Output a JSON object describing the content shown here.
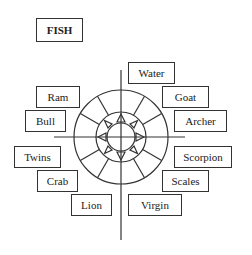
{
  "title": "FISH",
  "labels": {
    "water": "Water",
    "goat": "Goat",
    "archer": "Archer",
    "ram": "Ram",
    "bull": "Bull",
    "twins": "Twins",
    "crab": "Crab",
    "lion": "Lion",
    "scorpion": "Scorpion",
    "scales": "Scales",
    "virgin": "Virgin"
  },
  "colors": {
    "line": "#333333",
    "background": "#ffffff"
  }
}
